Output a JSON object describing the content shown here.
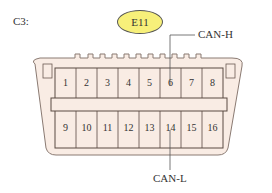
{
  "title": "C3:",
  "badge": "E11",
  "colors": {
    "badge_fill": "#f7f07a",
    "connector_fill": "#f9ece4",
    "outline": "#6b5a52"
  },
  "labels": {
    "top": "CAN-H",
    "bottom": "CAN-L"
  },
  "pins_top": [
    "1",
    "2",
    "3",
    "4",
    "5",
    "6",
    "7",
    "8"
  ],
  "pins_bottom": [
    "9",
    "10",
    "11",
    "12",
    "13",
    "14",
    "15",
    "16"
  ]
}
